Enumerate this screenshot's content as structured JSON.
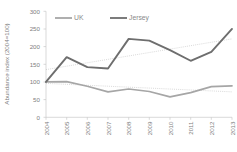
{
  "chart_data": {
    "type": "line",
    "title": "",
    "xlabel": "",
    "ylabel": "Abundance index (2004=100)",
    "categories": [
      "2004",
      "2005",
      "2006",
      "2007",
      "2008",
      "2009",
      "2010",
      "2011",
      "2012",
      "2013"
    ],
    "x": [
      2004,
      2005,
      2006,
      2007,
      2008,
      2009,
      2010,
      2011,
      2012,
      2013
    ],
    "series": [
      {
        "name": "UK",
        "color": "#a6a6a6",
        "values": [
          100,
          101,
          88,
          72,
          80,
          73,
          58,
          70,
          87,
          89
        ]
      },
      {
        "name": "Jersey",
        "color": "#6e6e6e",
        "values": [
          100,
          170,
          142,
          138,
          222,
          217,
          190,
          160,
          185,
          250
        ]
      }
    ],
    "trendlines": [
      {
        "name": "UK trendline",
        "of_series": "UK",
        "color": "#bfbfbf",
        "style": "dotted",
        "start_value": 96,
        "end_value": 72
      },
      {
        "name": "Jersey trendline",
        "of_series": "Jersey",
        "color": "#bfbfbf",
        "style": "dotted",
        "start_value": 135,
        "end_value": 222
      }
    ],
    "ylim": [
      0,
      300
    ],
    "yticks": [
      0,
      50,
      100,
      150,
      200,
      250,
      300
    ],
    "ytick_labels": [
      "0",
      "50",
      "100",
      "150",
      "200",
      "250",
      "300"
    ],
    "grid": false,
    "legend_position": "top",
    "legend_entries": [
      "UK",
      "Jersey"
    ]
  },
  "legend": {
    "items": [
      {
        "label": "UK",
        "color": "#a6a6a6"
      },
      {
        "label": "Jersey",
        "color": "#6e6e6e"
      }
    ]
  },
  "axes": {
    "y_title": "Abundance index (2004=100)",
    "y_labels": [
      "300",
      "250",
      "200",
      "150",
      "100",
      "50",
      "0"
    ],
    "x_labels": [
      "2004",
      "2005",
      "2006",
      "2007",
      "2008",
      "2009",
      "2010",
      "2011",
      "2012",
      "2013"
    ]
  },
  "caption": {
    "text": ""
  }
}
